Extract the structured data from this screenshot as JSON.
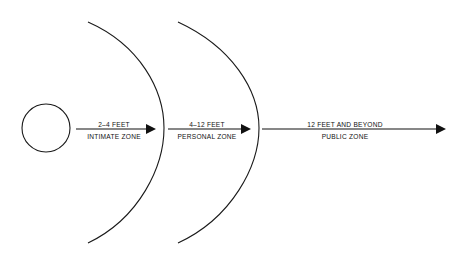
{
  "diagram": {
    "background_color": "#ffffff",
    "line_color": "#111111",
    "person": {
      "name": "person-circle",
      "cx": 46,
      "cy": 128,
      "r": 24
    },
    "arcs": [
      {
        "name": "intimate-zone-boundary-arc",
        "top_x": 88,
        "top_y": 22,
        "bottom_x": 88,
        "bottom_y": 243,
        "apex_x": 164,
        "apex_y": 128
      },
      {
        "name": "personal-zone-boundary-arc",
        "top_x": 178,
        "top_y": 22,
        "bottom_x": 178,
        "bottom_y": 243,
        "apex_x": 259,
        "apex_y": 128
      }
    ],
    "arrows": [
      {
        "name": "intimate-zone-arrow",
        "distance_label": "2–4 FEET",
        "zone_label": "INTIMATE ZONE",
        "x_start": 76,
        "x_end": 155,
        "y": 129,
        "label_center_x": 114
      },
      {
        "name": "personal-zone-arrow",
        "distance_label": "4–12 FEET",
        "zone_label": "PERSONAL ZONE",
        "x_start": 168,
        "x_end": 250,
        "y": 129,
        "label_center_x": 207
      },
      {
        "name": "public-zone-arrow",
        "distance_label": "12 FEET AND BEYOND",
        "zone_label": "PUBLIC ZONE",
        "x_start": 262,
        "x_end": 446,
        "y": 129,
        "label_center_x": 345
      }
    ]
  }
}
